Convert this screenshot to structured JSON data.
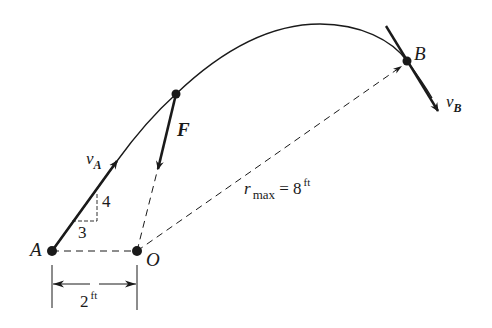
{
  "figure": {
    "points": {
      "A": {
        "label": "A"
      },
      "O": {
        "label": "O"
      },
      "B": {
        "label": "B"
      },
      "F_point": {
        "label": ""
      }
    },
    "vectors": {
      "vA": {
        "symbol": "v",
        "subscript": "A"
      },
      "vB": {
        "symbol": "v",
        "subscript": "B"
      },
      "F": {
        "label": "F"
      }
    },
    "slope": {
      "rise": "4",
      "run": "3"
    },
    "dimensions": {
      "AO": {
        "value": "2",
        "unit": "ft"
      },
      "rmax": {
        "symbol": "r",
        "subscript": "max",
        "equals": "=",
        "value": "8",
        "unit": "ft"
      }
    },
    "colors": {
      "ink": "#1a1a1a",
      "background": "#ffffff"
    }
  }
}
